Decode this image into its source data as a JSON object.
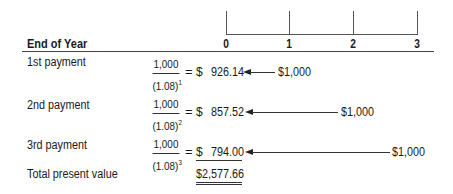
{
  "header": {
    "title": "End of Year",
    "years": [
      "0",
      "1",
      "2",
      "3"
    ]
  },
  "rows": [
    {
      "label": "1st payment",
      "numerator": "1,000",
      "denominator_base": "(1.08)",
      "exponent": "1",
      "equals": "=",
      "currency": "$",
      "present_value": "926.14",
      "cash_flow": "$1,000",
      "cash_flow_year": 1
    },
    {
      "label": "2nd payment",
      "numerator": "1,000",
      "denominator_base": "(1.08)",
      "exponent": "2",
      "equals": "=",
      "currency": "$",
      "present_value": "857.52",
      "cash_flow": "$1,000",
      "cash_flow_year": 2
    },
    {
      "label": "3rd payment",
      "numerator": "1,000",
      "denominator_base": "(1.08)",
      "exponent": "3",
      "equals": "=",
      "currency": "$",
      "present_value": "794.00",
      "cash_flow": "$1,000",
      "cash_flow_year": 3
    }
  ],
  "total": {
    "label": "Total present value",
    "value": "$2,577.66"
  },
  "colors": {
    "text": "#1a1a1a",
    "lines": "#555555"
  }
}
